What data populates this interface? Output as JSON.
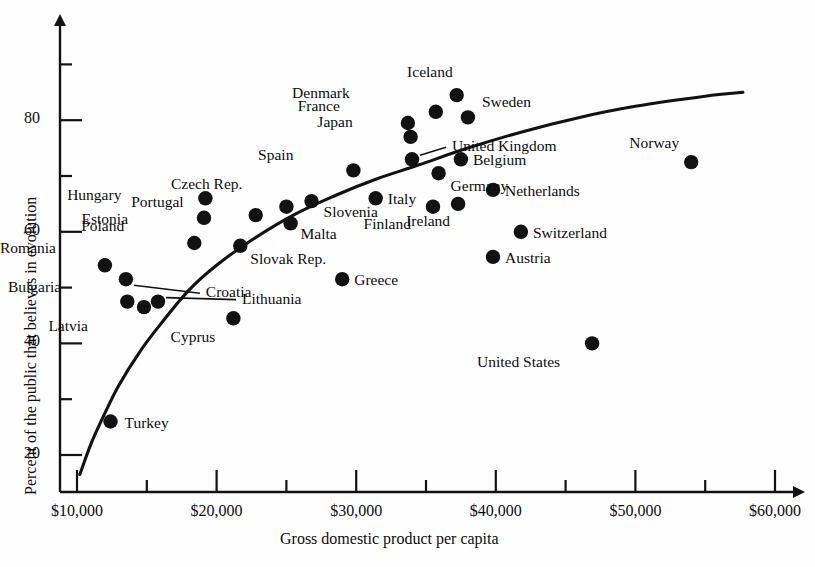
{
  "chart_data": {
    "type": "scatter",
    "title": "",
    "xlabel": "Gross domestic product per capita",
    "ylabel": "Percent of the public that believes in evolution",
    "xlim": [
      9000,
      62000
    ],
    "ylim": [
      15,
      92
    ],
    "grid": false,
    "legend": "none",
    "xticks": [
      "$10,000",
      "$20,000",
      "$30,000",
      "$40,000",
      "$50,000",
      "$60,000"
    ],
    "xtick_values": [
      10000,
      20000,
      30000,
      40000,
      50000,
      60000
    ],
    "xminor_values": [
      15000,
      25000,
      35000,
      45000,
      55000
    ],
    "yticks": [
      "20",
      "40",
      "60",
      "80"
    ],
    "ytick_values": [
      20,
      40,
      60,
      80
    ],
    "yminor_values": [
      30,
      50,
      70,
      90
    ],
    "trendline": {
      "description": "logarithmic fit curve rising from lower-left to upper-right",
      "points": [
        [
          10200,
          16.5
        ],
        [
          11000,
          22.0
        ],
        [
          12000,
          27.5
        ],
        [
          13000,
          32.5
        ],
        [
          14500,
          38.5
        ],
        [
          16000,
          43.5
        ],
        [
          18000,
          49.5
        ],
        [
          20000,
          54.0
        ],
        [
          22500,
          58.5
        ],
        [
          25500,
          63.0
        ],
        [
          28500,
          66.5
        ],
        [
          31500,
          69.5
        ],
        [
          34500,
          72.0
        ],
        [
          38000,
          75.0
        ],
        [
          42000,
          78.0
        ],
        [
          46000,
          80.5
        ],
        [
          50000,
          82.5
        ],
        [
          55000,
          84.3
        ],
        [
          57700,
          85.0
        ]
      ]
    },
    "points": [
      {
        "country": "Iceland",
        "gdp": 37200,
        "percent": 84.5,
        "label_dx": -6,
        "label_dy": -22,
        "leader": false
      },
      {
        "country": "Denmark",
        "gdp": 35700,
        "percent": 81.5,
        "label_dx": -88,
        "label_dy": -18,
        "leader": false
      },
      {
        "country": "Sweden",
        "gdp": 38000,
        "percent": 80.5,
        "label_dx": 14,
        "label_dy": -14,
        "leader": false
      },
      {
        "country": "France",
        "gdp": 33700,
        "percent": 79.5,
        "label_dx": -70,
        "label_dy": -16,
        "leader": false
      },
      {
        "country": "Japan",
        "gdp": 33900,
        "percent": 77.0,
        "label_dx": -60,
        "label_dy": -14,
        "leader": false
      },
      {
        "country": "United Kingdom",
        "gdp": 34000,
        "percent": 73.0,
        "label_dx": 40,
        "label_dy": -12,
        "leader": true
      },
      {
        "country": "Belgium",
        "gdp": 37500,
        "percent": 73.0,
        "label_dx": 12,
        "label_dy": 2,
        "leader": false
      },
      {
        "country": "Spain",
        "gdp": 29800,
        "percent": 71.0,
        "label_dx": -62,
        "label_dy": -14,
        "leader": false
      },
      {
        "country": "Germany",
        "gdp": 35900,
        "percent": 70.5,
        "label_dx": 12,
        "label_dy": 14,
        "leader": false
      },
      {
        "country": "Italy",
        "gdp": 31400,
        "percent": 66.0,
        "label_dx": 12,
        "label_dy": 2,
        "leader": false
      },
      {
        "country": "Czech Rep.",
        "gdp": 25000,
        "percent": 64.5,
        "label_dx": -46,
        "label_dy": -22,
        "leader": false
      },
      {
        "country": "Netherlands",
        "gdp": 39800,
        "percent": 67.5,
        "label_dx": 12,
        "label_dy": 2,
        "leader": false
      },
      {
        "country": "Hungary",
        "gdp": 19200,
        "percent": 66.0,
        "label_dx": -86,
        "label_dy": -2,
        "leader": false
      },
      {
        "country": "Slovenia",
        "gdp": 26800,
        "percent": 65.5,
        "label_dx": 12,
        "label_dy": 12,
        "leader": false
      },
      {
        "country": "Finland",
        "gdp": 35500,
        "percent": 64.5,
        "label_dx": -24,
        "label_dy": 18,
        "leader": false
      },
      {
        "country": "Ireland",
        "gdp": 37300,
        "percent": 65.0,
        "label_dx": -10,
        "label_dy": 18,
        "leader": false
      },
      {
        "country": "Estonia",
        "gdp": 19100,
        "percent": 62.5,
        "label_dx": -78,
        "label_dy": 2,
        "leader": false
      },
      {
        "country": "Portugal",
        "gdp": 22800,
        "percent": 63.0,
        "label_dx": -74,
        "label_dy": -12,
        "leader": false
      },
      {
        "country": "Malta",
        "gdp": 25300,
        "percent": 61.5,
        "label_dx": 10,
        "label_dy": 12,
        "leader": false
      },
      {
        "country": "Switzerland",
        "gdp": 41800,
        "percent": 60.0,
        "label_dx": 12,
        "label_dy": 2,
        "leader": false
      },
      {
        "country": "Poland",
        "gdp": 18400,
        "percent": 58.0,
        "label_dx": -72,
        "label_dy": -16,
        "leader": false
      },
      {
        "country": "Slovak Rep.",
        "gdp": 21700,
        "percent": 57.5,
        "label_dx": 10,
        "label_dy": 14,
        "leader": false
      },
      {
        "country": "Austria",
        "gdp": 39800,
        "percent": 55.5,
        "label_dx": 12,
        "label_dy": 2,
        "leader": false
      },
      {
        "country": "Romania",
        "gdp": 12000,
        "percent": 54.0,
        "label_dx": -76,
        "label_dy": -16,
        "leader": false
      },
      {
        "country": "Croatia",
        "gdp": 13500,
        "percent": 51.5,
        "label_dx": 80,
        "label_dy": 14,
        "leader": true
      },
      {
        "country": "Greece",
        "gdp": 29000,
        "percent": 51.5,
        "label_dx": 12,
        "label_dy": 2,
        "leader": false
      },
      {
        "country": "Bulgaria",
        "gdp": 13600,
        "percent": 47.5,
        "label_dx": -68,
        "label_dy": -14,
        "leader": false
      },
      {
        "country": "Lithuania",
        "gdp": 15800,
        "percent": 47.5,
        "label_dx": 84,
        "label_dy": -2,
        "leader": true
      },
      {
        "country": "Latvia",
        "gdp": 14800,
        "percent": 46.5,
        "label_dx": -58,
        "label_dy": 20,
        "leader": false
      },
      {
        "country": "Cyprus",
        "gdp": 21200,
        "percent": 44.5,
        "label_dx": -20,
        "label_dy": 20,
        "leader": false
      },
      {
        "country": "United States",
        "gdp": 46900,
        "percent": 40.0,
        "label_dx": -34,
        "label_dy": 20,
        "leader": false
      },
      {
        "country": "Norway",
        "gdp": 54000,
        "percent": 72.5,
        "label_dx": -14,
        "label_dy": -18,
        "leader": false
      },
      {
        "country": "Turkey",
        "gdp": 12400,
        "percent": 26.0,
        "label_dx": 14,
        "label_dy": 2,
        "leader": false
      }
    ]
  },
  "geometry": {
    "x0_px": 77,
    "x0_val": 10000,
    "x_px_per_1000": 13.96,
    "y0_px": 455,
    "y0_val": 20,
    "y_px_per_unit": 5.58,
    "axis_origin_x": 60,
    "axis_origin_y": 492,
    "axis_top_y": 16,
    "axis_right_x": 805
  },
  "style": {
    "dot_color": "#121212",
    "axis_color": "#121212",
    "curve_color": "#121212",
    "background": "#fefefe"
  }
}
